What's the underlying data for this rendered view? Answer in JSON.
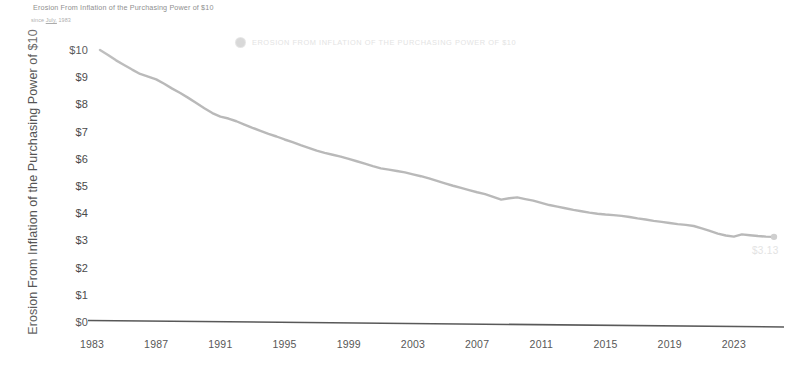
{
  "chart_data": {
    "type": "line",
    "title": "Erosion From Inflation of the Purchasing Power of $10",
    "subtitle_prefix": "since",
    "subtitle_link": "July,",
    "subtitle_suffix": "1983",
    "xlabel": "",
    "ylabel": "Erosion From Inflation of the Purchasing Power of $10",
    "legend": [
      {
        "name": "EROSION FROM INFLATION OF THE PURCHASING POWER OF $10",
        "color": "#d3d3d3"
      }
    ],
    "legend_position": "top-center",
    "grid": false,
    "line_color": "#b5b5b5",
    "axis_color": "#4a4a4a",
    "xlim": [
      1983,
      2026
    ],
    "ylim": [
      0,
      10
    ],
    "x_ticks": [
      "1983",
      "1987",
      "1991",
      "1995",
      "1999",
      "2003",
      "2007",
      "2011",
      "2015",
      "2019",
      "2023"
    ],
    "x_tick_values": [
      1983,
      1987,
      1991,
      1995,
      1999,
      2003,
      2007,
      2011,
      2015,
      2019,
      2023
    ],
    "y_ticks": [
      "$10",
      "$9",
      "$8",
      "$7",
      "$6",
      "$5",
      "$4",
      "$3",
      "$2",
      "$1",
      "$0"
    ],
    "y_tick_values": [
      10,
      9,
      8,
      7,
      6,
      5,
      4,
      3,
      2,
      1,
      0
    ],
    "end_point_label": "$3.13",
    "end_point": {
      "x": 2025.5,
      "y": 3.13
    },
    "series": [
      {
        "name": "EROSION FROM INFLATION OF THE PURCHASING POWER OF $10",
        "color": "#b5b5b5",
        "x": [
          1983.5,
          1984,
          1984.5,
          1985,
          1985.5,
          1986,
          1986.5,
          1987,
          1987.5,
          1988,
          1988.5,
          1989,
          1989.5,
          1990,
          1990.5,
          1991,
          1991.5,
          1992,
          1992.5,
          1993,
          1993.5,
          1994,
          1994.5,
          1995,
          1995.5,
          1996,
          1996.5,
          1997,
          1997.5,
          1998,
          1998.5,
          1999,
          1999.5,
          2000,
          2000.5,
          2001,
          2001.5,
          2002,
          2002.5,
          2003,
          2003.5,
          2004,
          2004.5,
          2005,
          2005.5,
          2006,
          2006.5,
          2007,
          2007.5,
          2008,
          2008.5,
          2009,
          2009.5,
          2010,
          2010.5,
          2011,
          2011.5,
          2012,
          2012.5,
          2013,
          2013.5,
          2014,
          2014.5,
          2015,
          2015.5,
          2016,
          2016.5,
          2017,
          2017.5,
          2018,
          2018.5,
          2019,
          2019.5,
          2020,
          2020.5,
          2021,
          2021.5,
          2022,
          2022.5,
          2023,
          2023.5,
          2024,
          2024.5,
          2025,
          2025.5
        ],
        "y": [
          10.0,
          9.82,
          9.62,
          9.45,
          9.28,
          9.12,
          9.02,
          8.92,
          8.76,
          8.58,
          8.42,
          8.24,
          8.05,
          7.86,
          7.68,
          7.55,
          7.48,
          7.38,
          7.26,
          7.14,
          7.03,
          6.92,
          6.82,
          6.71,
          6.61,
          6.5,
          6.4,
          6.3,
          6.22,
          6.15,
          6.08,
          6.0,
          5.91,
          5.82,
          5.73,
          5.65,
          5.6,
          5.55,
          5.5,
          5.43,
          5.36,
          5.28,
          5.19,
          5.1,
          5.01,
          4.93,
          4.85,
          4.77,
          4.7,
          4.6,
          4.5,
          4.55,
          4.58,
          4.52,
          4.46,
          4.38,
          4.3,
          4.24,
          4.18,
          4.12,
          4.07,
          4.02,
          3.98,
          3.95,
          3.93,
          3.9,
          3.86,
          3.81,
          3.77,
          3.72,
          3.68,
          3.64,
          3.6,
          3.57,
          3.53,
          3.44,
          3.35,
          3.25,
          3.18,
          3.14,
          3.22,
          3.19,
          3.16,
          3.14,
          3.13
        ]
      }
    ]
  }
}
